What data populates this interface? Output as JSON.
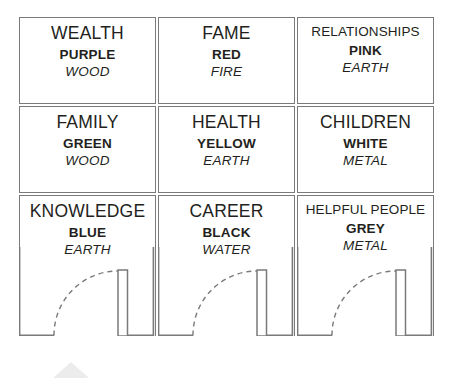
{
  "diagram": {
    "line_color": "#7a7a7a",
    "text_color": "#231f20",
    "watermark_color": "#ebebeb"
  },
  "cells": [
    {
      "area": "WEALTH",
      "color": "PURPLE",
      "element": "WOOD",
      "has_door": false,
      "small_title": false
    },
    {
      "area": "FAME",
      "color": "RED",
      "element": "FIRE",
      "has_door": false,
      "small_title": false
    },
    {
      "area": "RELATIONSHIPS",
      "color": "PINK",
      "element": "EARTH",
      "has_door": false,
      "small_title": true
    },
    {
      "area": "FAMILY",
      "color": "GREEN",
      "element": "WOOD",
      "has_door": false,
      "small_title": false
    },
    {
      "area": "HEALTH",
      "color": "YELLOW",
      "element": "EARTH",
      "has_door": false,
      "small_title": false
    },
    {
      "area": "CHILDREN",
      "color": "WHITE",
      "element": "METAL",
      "has_door": false,
      "small_title": false
    },
    {
      "area": "KNOWLEDGE",
      "color": "BLUE",
      "element": "EARTH",
      "has_door": true,
      "small_title": false
    },
    {
      "area": "CAREER",
      "color": "BLACK",
      "element": "WATER",
      "has_door": true,
      "small_title": false
    },
    {
      "area": "HELPFUL PEOPLE",
      "color": "GREY",
      "element": "METAL",
      "has_door": true,
      "small_title": true
    }
  ]
}
